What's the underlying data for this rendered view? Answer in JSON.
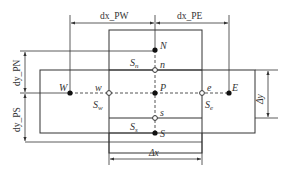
{
  "diagram": {
    "nodes": {
      "P": "P",
      "N": "N",
      "S": "S",
      "W": "W",
      "E": "E",
      "n": "n",
      "s": "s",
      "w": "w",
      "e": "e"
    },
    "faces": {
      "Sn": "S",
      "Sn_sub": "n",
      "Ss": "S",
      "Ss_sub": "s",
      "Sw": "S",
      "Sw_sub": "w",
      "Se": "S",
      "Se_sub": "e"
    },
    "dimensions": {
      "dx_PW": "dx_PW",
      "dx_PE": "dx_PE",
      "dy_PN": "dy_PN",
      "dy_PS": "dy_PS",
      "delta_x": "Δx",
      "delta_y": "Δy"
    },
    "colors": {
      "line": "#333333",
      "dash": "#555555"
    }
  }
}
